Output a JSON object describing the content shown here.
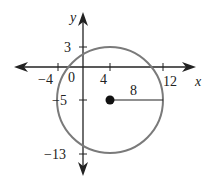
{
  "diagram": {
    "type": "circle-on-coordinate-plane",
    "axes": {
      "x_label": "x",
      "y_label": "y"
    },
    "x_ticks": [
      {
        "value": -4,
        "label": "−4"
      },
      {
        "value": 4,
        "label": "4"
      },
      {
        "value": 12,
        "label": "12"
      }
    ],
    "y_ticks": [
      {
        "value": 3,
        "label": "3"
      },
      {
        "value": -5,
        "label": "−5"
      },
      {
        "value": -13,
        "label": "−13"
      }
    ],
    "origin_label": "0",
    "circle": {
      "center": [
        4,
        -5
      ],
      "radius": 8,
      "radius_label": "8",
      "stroke_color": "#7a7a7a"
    },
    "colors": {
      "axis": "#222222",
      "circle": "#7a7a7a",
      "center_point": "#111111"
    }
  }
}
